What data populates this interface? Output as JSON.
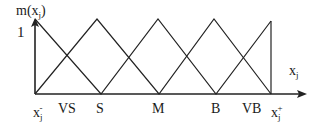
{
  "diagram": {
    "type": "fuzzy-membership-functions",
    "y_axis_label": {
      "base": "m(x",
      "sub": "j",
      "close": ")"
    },
    "y_tick_label": "1",
    "x_axis_label": {
      "base": "x",
      "sub": "j"
    },
    "x_min_label": {
      "base": "x",
      "sub": "j",
      "sup": "-"
    },
    "x_max_label": {
      "base": "x",
      "sub": "j",
      "sup": "+"
    },
    "sets": [
      {
        "label": "VS"
      },
      {
        "label": "S"
      },
      {
        "label": "M"
      },
      {
        "label": "B"
      },
      {
        "label": "VB"
      }
    ],
    "stroke_color": "#222222"
  }
}
